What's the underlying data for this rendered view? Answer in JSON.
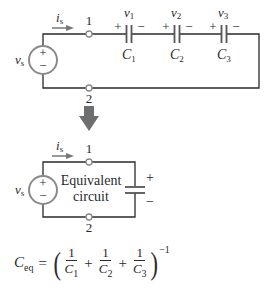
{
  "top_circuit": {
    "source_label": "v",
    "source_sub": "s",
    "source_plus": "+",
    "source_minus": "−",
    "current_label": "i",
    "current_sub": "s",
    "node_top": "1",
    "node_bottom": "2",
    "capacitors": [
      {
        "voltage": "v",
        "voltage_sub": "1",
        "name": "C",
        "name_sub": "1",
        "plus": "+",
        "minus": "−"
      },
      {
        "voltage": "v",
        "voltage_sub": "2",
        "name": "C",
        "name_sub": "2",
        "plus": "+",
        "minus": "−"
      },
      {
        "voltage": "v",
        "voltage_sub": "3",
        "name": "C",
        "name_sub": "3",
        "plus": "+",
        "minus": "−"
      }
    ]
  },
  "arrow": {
    "direction": "down",
    "color": "#707070"
  },
  "bottom_circuit": {
    "source_label": "v",
    "source_sub": "s",
    "source_plus": "+",
    "source_minus": "−",
    "current_label": "i",
    "current_sub": "s",
    "node_top": "1",
    "node_bottom": "2",
    "box_line1": "Equivalent",
    "box_line2": "circuit",
    "cap_plus": "+",
    "cap_minus": "−"
  },
  "formula": {
    "lhs": "C",
    "lhs_sub": "eq",
    "equals": "=",
    "open_paren": "(",
    "close_paren": ")",
    "terms": [
      {
        "num": "1",
        "den": "C",
        "den_sub": "1"
      },
      {
        "num": "1",
        "den": "C",
        "den_sub": "2"
      },
      {
        "num": "1",
        "den": "C",
        "den_sub": "3"
      }
    ],
    "plus": "+",
    "exponent": "−1"
  },
  "colors": {
    "wire": "#2a2a2a",
    "source_circle": "#8a8a8a",
    "current_arrow": "#777777",
    "node": "#888888",
    "big_arrow": "#6e6e6e"
  }
}
